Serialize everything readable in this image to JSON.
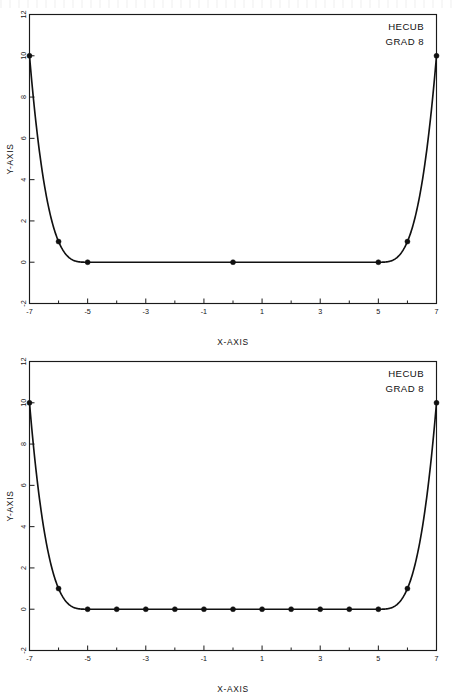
{
  "page": {
    "background_color": "#ffffff",
    "ink_color": "#111111",
    "figure_count": 2
  },
  "figures": [
    {
      "id": "top-figure",
      "annotation": {
        "line1": "HECUB",
        "line2": "GRAD 8"
      },
      "chart_data": {
        "type": "line",
        "title": "",
        "subtitle": "",
        "xlabel": "X-AXIS",
        "ylabel": "Y-AXIS",
        "xlim": [
          -7,
          7
        ],
        "ylim": [
          -2,
          12
        ],
        "xticks": [
          -7,
          -5,
          -3,
          -1,
          1,
          3,
          5,
          7
        ],
        "xticklabels": [
          "-7",
          "-5",
          "-3",
          "-1",
          "1",
          "3",
          "5",
          "7"
        ],
        "xminorticks": [
          -6,
          -4,
          -2,
          0,
          2,
          4,
          6
        ],
        "yticks": [
          -2,
          0,
          2,
          4,
          6,
          8,
          10,
          12
        ],
        "yticklabels": [
          "-2",
          "0",
          "2",
          "4",
          "6",
          "8",
          "10",
          "12"
        ],
        "grid": false,
        "legend": "none",
        "annotations": [
          "HECUB",
          "GRAD 8"
        ],
        "series": [
          {
            "name": "HECUB GRAD 8",
            "marker": "filled-circle",
            "line": "solid",
            "x": [
              -7,
              -6,
              -5,
              0,
              5,
              6,
              7
            ],
            "y": [
              10,
              1,
              0,
              0,
              0,
              1,
              10
            ]
          }
        ]
      }
    },
    {
      "id": "bottom-figure",
      "annotation": {
        "line1": "HECUB",
        "line2": "GRAD 8"
      },
      "chart_data": {
        "type": "line",
        "title": "",
        "subtitle": "",
        "xlabel": "X-AXIS",
        "ylabel": "Y-AXIS",
        "xlim": [
          -7,
          7
        ],
        "ylim": [
          -2,
          12
        ],
        "xticks": [
          -7,
          -5,
          -3,
          -1,
          1,
          3,
          5,
          7
        ],
        "xticklabels": [
          "-7",
          "-5",
          "-3",
          "-1",
          "1",
          "3",
          "5",
          "7"
        ],
        "xminorticks": [
          -6,
          -4,
          -2,
          0,
          2,
          4,
          6
        ],
        "yticks": [
          -2,
          0,
          2,
          4,
          6,
          8,
          10,
          12
        ],
        "yticklabels": [
          "-2",
          "0",
          "2",
          "4",
          "6",
          "8",
          "10",
          "12"
        ],
        "grid": false,
        "legend": "none",
        "annotations": [
          "HECUB",
          "GRAD 8"
        ],
        "series": [
          {
            "name": "HECUB GRAD 8",
            "marker": "filled-circle",
            "line": "solid",
            "x": [
              -7,
              -6,
              -5,
              -4,
              -3,
              -2,
              -1,
              0,
              1,
              2,
              3,
              4,
              5,
              6,
              7
            ],
            "y": [
              10,
              1,
              0,
              0,
              0,
              0,
              0,
              0,
              0,
              0,
              0,
              0,
              0,
              1,
              10
            ]
          }
        ]
      }
    }
  ]
}
